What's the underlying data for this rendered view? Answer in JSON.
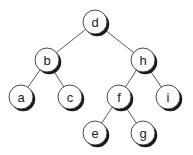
{
  "diagram": {
    "type": "binary-tree",
    "nodes": [
      {
        "id": "d",
        "label": "d",
        "x": 95,
        "y": 22
      },
      {
        "id": "b",
        "label": "b",
        "x": 47,
        "y": 60
      },
      {
        "id": "h",
        "label": "h",
        "x": 143,
        "y": 60
      },
      {
        "id": "a",
        "label": "a",
        "x": 21,
        "y": 97
      },
      {
        "id": "c",
        "label": "c",
        "x": 70,
        "y": 97
      },
      {
        "id": "f",
        "label": "f",
        "x": 119,
        "y": 97
      },
      {
        "id": "i",
        "label": "i",
        "x": 168,
        "y": 97
      },
      {
        "id": "e",
        "label": "e",
        "x": 95,
        "y": 133
      },
      {
        "id": "g",
        "label": "g",
        "x": 143,
        "y": 133
      }
    ],
    "edges": [
      [
        "d",
        "b"
      ],
      [
        "d",
        "h"
      ],
      [
        "b",
        "a"
      ],
      [
        "b",
        "c"
      ],
      [
        "h",
        "f"
      ],
      [
        "h",
        "i"
      ],
      [
        "f",
        "e"
      ],
      [
        "f",
        "g"
      ]
    ],
    "node_radius": 12
  }
}
